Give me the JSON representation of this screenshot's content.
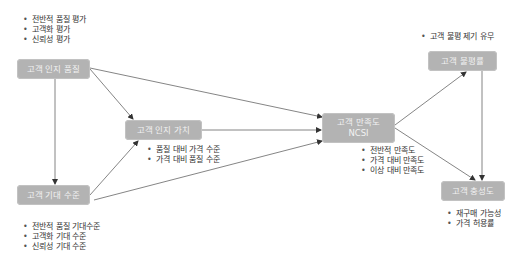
{
  "diagram": {
    "nodes": {
      "perceived_quality": {
        "label": "고객 인지 품질"
      },
      "perceived_value": {
        "label": "고객 인지 가치"
      },
      "satisfaction": {
        "label": "고객 만족도",
        "sublabel": "NCSI"
      },
      "expectation": {
        "label": "고객 기대 수준"
      },
      "complaint": {
        "label": "고객 불평률"
      },
      "loyalty": {
        "label": "고객 충성도"
      }
    },
    "bullets": {
      "perceived_quality": [
        "전반적 품질 평가",
        "고객화 평가",
        "신뢰성 평가"
      ],
      "perceived_value": [
        "품질 대비 가격 수준",
        "가격 대비 품질 수준"
      ],
      "satisfaction": [
        "전반적 만족도",
        "가격 대비 만족도",
        "이상 대비 만족도"
      ],
      "expectation": [
        "전반적 품질 기대수준",
        "고객화 기대 수준",
        "신뢰성 기대 수준"
      ],
      "complaint": [
        "고객 불평 제기 유무"
      ],
      "loyalty": [
        "재구매 가능성",
        "가격 허용률"
      ]
    },
    "edges": [
      {
        "from": "고객 인지 품질",
        "to": "고객 인지 가치"
      },
      {
        "from": "고객 인지 품질",
        "to": "고객 만족도"
      },
      {
        "from": "고객 인지 품질",
        "to": "고객 기대 수준"
      },
      {
        "from": "고객 기대 수준",
        "to": "고객 인지 가치"
      },
      {
        "from": "고객 기대 수준",
        "to": "고객 만족도"
      },
      {
        "from": "고객 인지 가치",
        "to": "고객 만족도"
      },
      {
        "from": "고객 만족도",
        "to": "고객 불평률"
      },
      {
        "from": "고객 만족도",
        "to": "고객 충성도"
      },
      {
        "from": "고객 불평률",
        "to": "고객 충성도"
      }
    ],
    "colors": {
      "node_fill": "#b3b3b3",
      "node_text": "#f2f2f2",
      "edge": "#555555",
      "bullet_text": "#333333"
    }
  }
}
